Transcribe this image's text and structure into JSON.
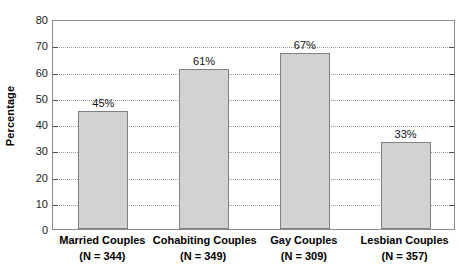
{
  "chart_data": {
    "type": "bar",
    "title": "",
    "xlabel": "",
    "ylabel": "Percentage",
    "ylim": [
      0,
      80
    ],
    "ytick_step": 10,
    "yticks": [
      "80",
      "70",
      "60",
      "50",
      "40",
      "30",
      "20",
      "10",
      "0"
    ],
    "grid": "horizontal-dotted",
    "legend": "none",
    "categories": [
      "Married Couples",
      "Cohabiting Couples",
      "Gay Couples",
      "Lesbian Couples"
    ],
    "category_sublabels": [
      "(N = 344)",
      "(N = 349)",
      "(N = 309)",
      "(N = 357)"
    ],
    "values": [
      45,
      61,
      67,
      33
    ],
    "value_labels": [
      "45%",
      "61%",
      "67%",
      "33%"
    ],
    "bar_fill_color": "#d2d2d2",
    "bar_border_color": "#808080",
    "grid_color": "#9a9a9a",
    "axis_color": "#8c8c8c",
    "text_color": "#000000"
  }
}
